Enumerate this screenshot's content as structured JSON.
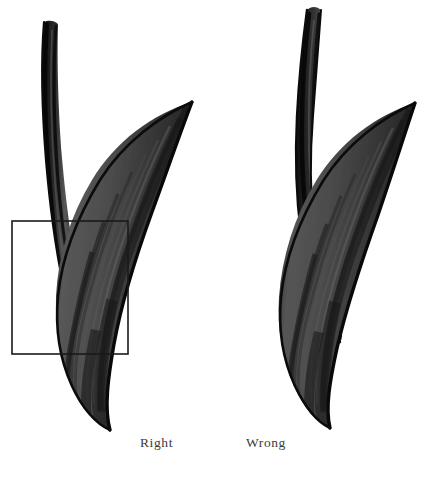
{
  "plate": {
    "title": "Brush-painted leaf comparison plate",
    "background_color": "#ffffff",
    "ink_color": "#111111",
    "blade_fill_color": "#4a4a4a",
    "blade_shadow_color": "#2a2a2a",
    "blade_highlight_color": "#6e6e6e",
    "stem_color": "#1a1a1a",
    "overlay_rect_color": "#1a1a1a"
  },
  "figures": [
    {
      "id": "left-figure",
      "caption": "Right",
      "description": "Leaf with long straight stem and blade, correct rendering",
      "has_overlay_rect": true,
      "overlay_rect": {
        "x": 12,
        "y": 221,
        "width": 116,
        "height": 133
      }
    },
    {
      "id": "right-figure",
      "caption": "Wrong",
      "description": "Leaf with curved stem and blade, incorrect rendering",
      "has_overlay_rect": false
    }
  ],
  "captions": {
    "left_label": "Right",
    "right_label": "Wrong"
  }
}
